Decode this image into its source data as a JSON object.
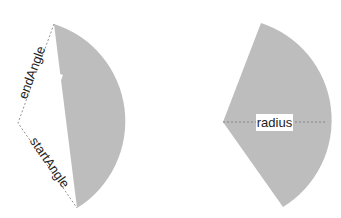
{
  "diagram": {
    "colors": {
      "fill": "#bdbdbd",
      "line": "#777777",
      "background": "#ffffff"
    },
    "left_figure": {
      "description": "segment (chord cut) with angles",
      "labels": {
        "end_angle": "endAngle",
        "start_angle": "startAngle"
      }
    },
    "right_figure": {
      "description": "sector with radius",
      "labels": {
        "radius": "radius"
      }
    }
  }
}
